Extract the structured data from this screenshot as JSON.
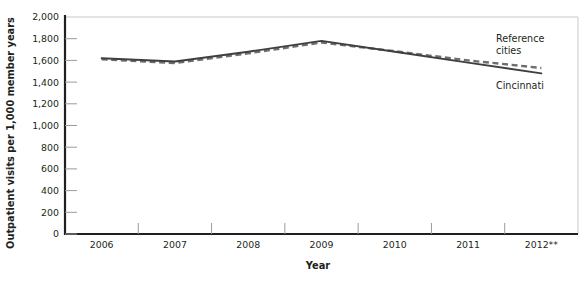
{
  "chart_data": {
    "type": "line",
    "title": "",
    "xlabel": "Year",
    "ylabel": "Outpatient visits per 1,000 member years",
    "categories": [
      "2006",
      "2007",
      "2008",
      "2009",
      "2010",
      "2011",
      "2012**"
    ],
    "ylim": [
      0,
      2000
    ],
    "ytick_step": 200,
    "ytick_labels": [
      "0",
      "200",
      "400",
      "600",
      "800",
      "1,000",
      "1,200",
      "1,400",
      "1,600",
      "1,800",
      "2,000"
    ],
    "ytick_values": [
      0,
      200,
      400,
      600,
      800,
      1000,
      1200,
      1400,
      1600,
      1800,
      2000
    ],
    "grid": "top-gridline-only",
    "legend_position": "inline-right",
    "series": [
      {
        "name": "Cincinnati",
        "style": "solid",
        "color": "#3f3f3f",
        "values": [
          1620,
          1590,
          1680,
          1780,
          1680,
          1580,
          1480
        ]
      },
      {
        "name": "Reference cities",
        "style": "dashed",
        "color": "#6e6e6e",
        "values": [
          1610,
          1575,
          1665,
          1765,
          1685,
          1600,
          1530
        ]
      }
    ],
    "annotations": [
      {
        "text": "Reference",
        "series": "Reference cities"
      },
      {
        "text": "cities",
        "series": "Reference cities"
      },
      {
        "text": "Cincinnati",
        "series": "Cincinnati"
      }
    ]
  },
  "labels": {
    "series_reference_line1": "Reference",
    "series_reference_line2": "cities",
    "series_cincinnati": "Cincinnati",
    "x_axis_title": "Year",
    "y_axis_title": "Outpatient visits per 1,000 member years"
  },
  "colors": {
    "axis": "#231f20",
    "gridline": "#c9c9c9",
    "cincinnati": "#3f3f3f",
    "reference_cities": "#6e6e6e",
    "text": "#231f20",
    "background": "#ffffff"
  }
}
